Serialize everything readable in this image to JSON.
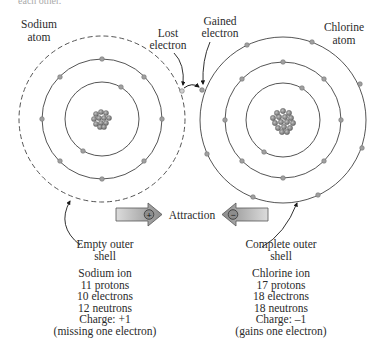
{
  "clipped_header": "each other.",
  "labels": {
    "sodium_atom": [
      "Sodium",
      "atom"
    ],
    "chlorine_atom": [
      "Chlorine",
      "atom"
    ],
    "lost_electron": [
      "Lost",
      "electron"
    ],
    "gained_electron": [
      "Gained",
      "electron"
    ],
    "attraction": "Attraction",
    "plus_sign": "+",
    "minus_sign": "−",
    "empty_outer_shell": [
      "Empty outer",
      "shell"
    ],
    "complete_outer_shell": [
      "Complete outer",
      "shell"
    ]
  },
  "sodium_ion": {
    "title": "Sodium ion",
    "protons": "11 protons",
    "electrons": "10 electrons",
    "neutrons": "12 neutrons",
    "charge": "Charge: +1",
    "note": "(missing one electron)"
  },
  "chlorine_ion": {
    "title": "Chlorine ion",
    "protons": "17 protons",
    "electrons": "18 electrons",
    "neutrons": "18 neutrons",
    "charge": "Charge: –1",
    "note": "(gains one electron)"
  },
  "atoms": {
    "sodium": {
      "center": [
        102,
        119
      ],
      "shells": [
        {
          "r": 37,
          "electrons": 2
        },
        {
          "r": 60,
          "electrons": 8
        },
        {
          "r": 83,
          "electrons": 0,
          "dashed": true
        }
      ]
    },
    "chlorine": {
      "center": [
        283,
        120
      ],
      "shells": [
        {
          "r": 37,
          "electrons": 2
        },
        {
          "r": 58,
          "electrons": 8
        },
        {
          "r": 83,
          "electrons": 8
        }
      ]
    }
  },
  "colors": {
    "shell_line": "#555555",
    "electron": "#9a9a9a",
    "nucleus": "#7a7a7a",
    "arrow_fill": "#a8a8a8",
    "text": "#2b2b2b"
  }
}
